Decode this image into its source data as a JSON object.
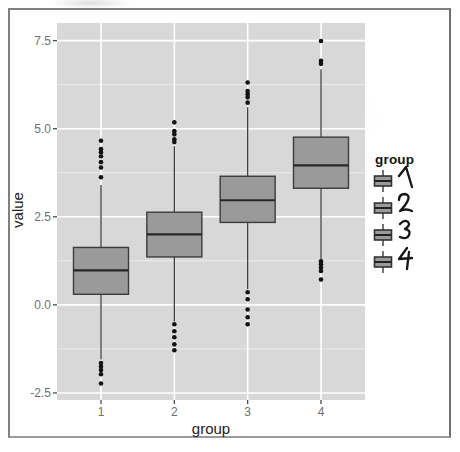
{
  "figure": {
    "y_axis_title": "value",
    "x_axis_title": "group",
    "legend": {
      "title": "group",
      "items": [
        {
          "label": "1"
        },
        {
          "label": "2"
        },
        {
          "label": "3"
        },
        {
          "label": "4"
        }
      ]
    }
  },
  "colors": {
    "panel_background": "#d8d8d8",
    "grid_major": "#ffffff",
    "box_fill": "#9a9a9a",
    "box_stroke": "#3c3c3c",
    "median_stroke": "#262626",
    "outlier_fill": "#121212",
    "tick_mark": "#4a4a4a",
    "tick_label": "#6f6f6f"
  },
  "chart_data": {
    "type": "boxplot",
    "title": "",
    "xlabel": "group",
    "ylabel": "value",
    "categories": [
      "1",
      "2",
      "3",
      "4"
    ],
    "y_ticks": [
      7.5,
      5.0,
      2.5,
      0.0,
      -2.5
    ],
    "y_tick_labels": [
      "7.5",
      "5.0",
      "2.5",
      "0.0",
      "-2.5"
    ],
    "y_minor_ticks": [
      6.25,
      3.75,
      1.25,
      -1.25
    ],
    "ylim": [
      -2.7,
      8.0
    ],
    "grid": true,
    "legend_position": "right",
    "series": [
      {
        "group": "1",
        "q1": 0.3,
        "median": 0.98,
        "q3": 1.63,
        "whisker_low": -1.55,
        "whisker_high": 3.4,
        "outliers_high": [
          3.62,
          3.9,
          4.05,
          4.22,
          4.33,
          4.42,
          4.66
        ],
        "outliers_low": [
          -1.65,
          -1.75,
          -1.85,
          -1.97,
          -2.23
        ]
      },
      {
        "group": "2",
        "q1": 1.36,
        "median": 2.0,
        "q3": 2.63,
        "whisker_low": -0.47,
        "whisker_high": 4.5,
        "outliers_high": [
          4.62,
          4.7,
          4.84,
          4.93,
          5.18
        ],
        "outliers_low": [
          -0.55,
          -0.75,
          -0.92,
          -1.12,
          -1.29
        ]
      },
      {
        "group": "3",
        "q1": 2.34,
        "median": 2.97,
        "q3": 3.65,
        "whisker_low": 0.44,
        "whisker_high": 5.61,
        "outliers_high": [
          5.74,
          5.89,
          5.98,
          6.07,
          6.31
        ],
        "outliers_low": [
          0.36,
          0.16,
          -0.13,
          -0.35,
          -0.55
        ]
      },
      {
        "group": "4",
        "q1": 3.31,
        "median": 3.96,
        "q3": 4.76,
        "whisker_low": 1.29,
        "whisker_high": 6.69,
        "outliers_high": [
          6.84,
          6.93,
          7.49
        ],
        "outliers_low": [
          1.24,
          1.15,
          1.06,
          0.96,
          0.72
        ]
      }
    ]
  }
}
